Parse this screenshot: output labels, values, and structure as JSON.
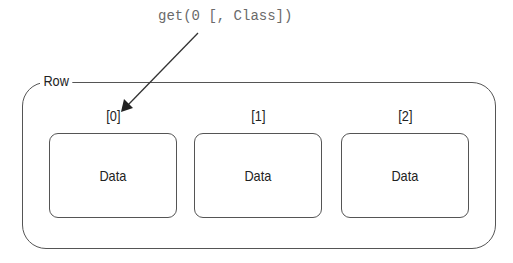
{
  "call": "get(0 [, Class])",
  "container": {
    "label": "Row"
  },
  "cells": [
    {
      "index": "[0]",
      "label": "Data"
    },
    {
      "index": "[1]",
      "label": "Data"
    },
    {
      "index": "[2]",
      "label": "Data"
    }
  ],
  "arrow": {
    "from": "call",
    "to": "[0]"
  },
  "colors": {
    "stroke": "#555555",
    "code_text": "#6a6a6a",
    "text": "#222222"
  }
}
